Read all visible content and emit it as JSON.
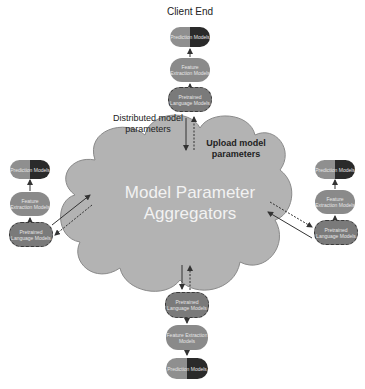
{
  "title": "Client End",
  "cloud": {
    "line1": "Model Parameter",
    "line2": "Aggregators"
  },
  "labels": {
    "distributed_line1": "Distributed model",
    "distributed_line2": "parameters",
    "upload_line1": "Upload model",
    "upload_line2": "parameters"
  },
  "clients": {
    "top": {
      "prediction": "Prediction Models",
      "feature": "Feature Extraction Models",
      "pretrained": "Pretrained Language Models"
    },
    "left": {
      "prediction": "Prediction Models",
      "feature": "Feature Extraction Models",
      "pretrained": "Pretrained Language Models"
    },
    "right": {
      "prediction": "Prediction Models",
      "feature": "Feature Extraction Models",
      "pretrained": "Pretrained Language Models"
    },
    "bottom": {
      "prediction": "Prediction Models",
      "feature": "Feature Extraction Models",
      "pretrained": "Pretrained Language Models"
    }
  },
  "colors": {
    "cloud_fill": "#b3b3b3",
    "cloud_stroke": "#8a8a8a",
    "node_dark": "#2a2a2a",
    "node_mid": "#8a8a8a"
  }
}
